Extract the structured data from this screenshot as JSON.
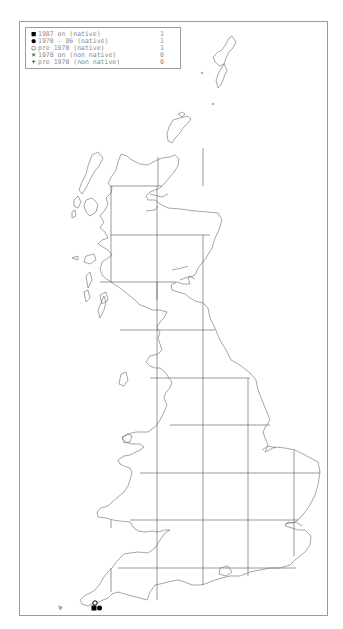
{
  "legend": {
    "items": [
      {
        "symbol": "filled-square",
        "glyph": "■",
        "label": "1987 on (native)",
        "count": "1"
      },
      {
        "symbol": "filled-circle",
        "glyph": "●",
        "label": "1970 - 86 (native)",
        "count": "1"
      },
      {
        "symbol": "open-circle",
        "glyph": "○",
        "label": "pre 1970 (native)",
        "count": "1"
      },
      {
        "symbol": "cross",
        "glyph": "✕",
        "label": "1970 on (non native)",
        "count": "0"
      },
      {
        "symbol": "plus",
        "glyph": "+",
        "label": "pre 1970 (non native)",
        "count": "0"
      }
    ]
  },
  "map": {
    "region": "Great Britain",
    "grid": {
      "vertical_x": [
        111,
        157,
        203,
        248,
        294
      ],
      "horizontal_y": [
        186,
        235,
        282,
        330,
        378,
        425,
        473,
        520,
        568
      ]
    },
    "records": [
      {
        "type": "open-circle",
        "x": 95,
        "y": 603
      },
      {
        "type": "filled-square",
        "x": 94,
        "y": 608
      },
      {
        "type": "filled-circle",
        "x": 99,
        "y": 608
      }
    ],
    "colors": {
      "coast": "#6a6a6a",
      "grid": "#555555",
      "frame": "#9a9a9a",
      "marker": "#000000"
    }
  }
}
